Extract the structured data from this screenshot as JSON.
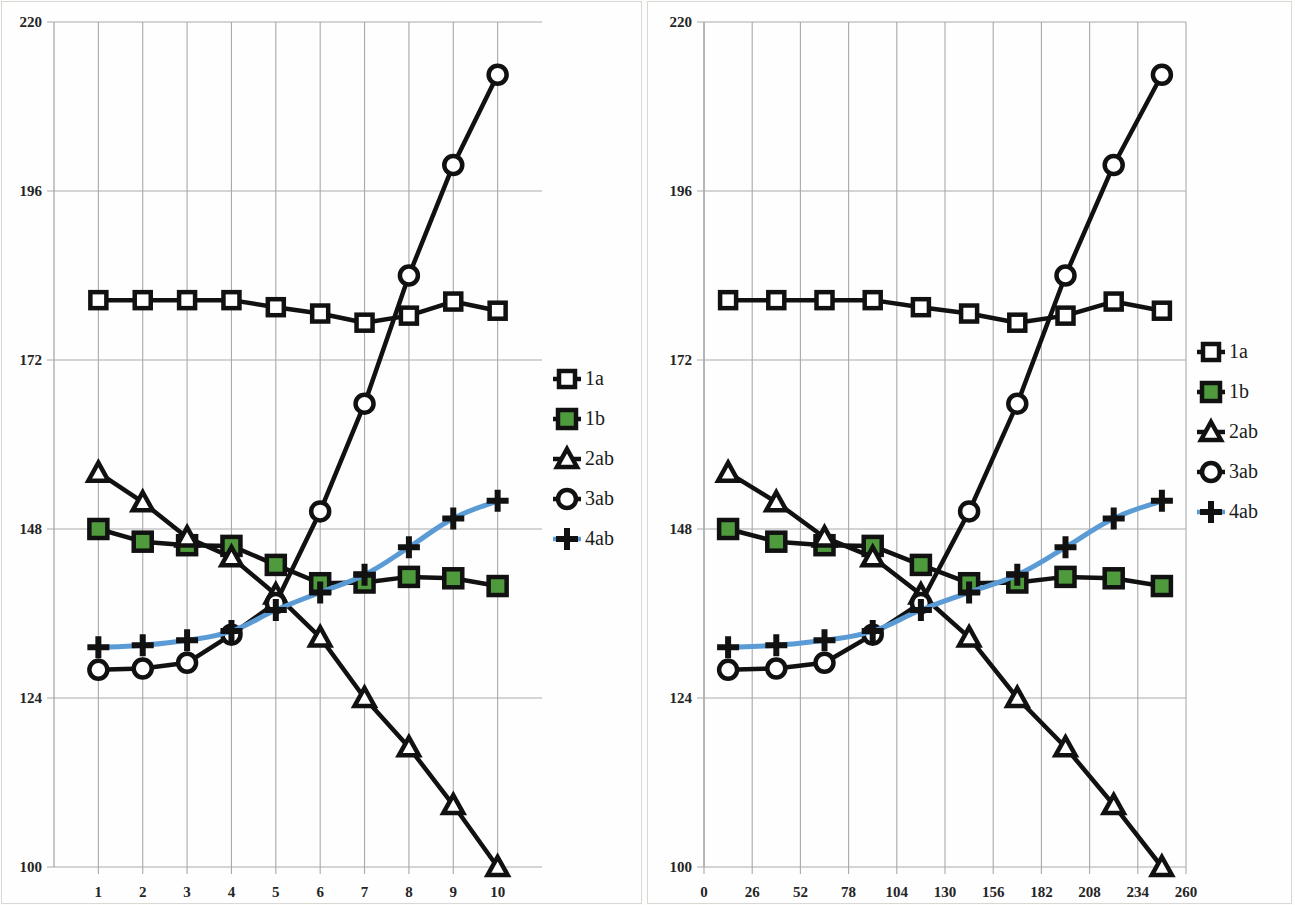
{
  "chart_data": [
    {
      "id": "left",
      "type": "line",
      "title": "",
      "xlabel": "",
      "ylabel": "",
      "grid": true,
      "legend_position": "right",
      "xlim": [
        0,
        11
      ],
      "ylim": [
        100,
        220
      ],
      "yticks": [
        100,
        124,
        148,
        172,
        196,
        220
      ],
      "xticks": [
        1,
        2,
        3,
        4,
        5,
        6,
        7,
        8,
        9,
        10
      ],
      "x": [
        1,
        2,
        3,
        4,
        5,
        6,
        7,
        8,
        9,
        10
      ],
      "series": [
        {
          "name": "1a",
          "marker": "square-open",
          "color": "#111111",
          "line_color": "#111111",
          "values": [
            180.5,
            180.5,
            180.5,
            180.5,
            179.5,
            178.6,
            177.3,
            178.3,
            180.3,
            179.0
          ]
        },
        {
          "name": "1b",
          "marker": "square-filled",
          "color": "#4E9A3C",
          "line_color": "#111111",
          "values": [
            148.0,
            146.2,
            145.7,
            145.6,
            142.9,
            140.3,
            140.4,
            141.2,
            141.0,
            139.9
          ]
        },
        {
          "name": "2ab",
          "marker": "triangle-open",
          "color": "#111111",
          "line_color": "#111111",
          "values": [
            156.0,
            151.8,
            146.8,
            144.0,
            138.7,
            132.6,
            124.0,
            117.0,
            108.8,
            100.0
          ]
        },
        {
          "name": "3ab",
          "marker": "circle-open",
          "color": "#111111",
          "line_color": "#111111",
          "values": [
            128.0,
            128.2,
            129.0,
            133.0,
            137.5,
            150.5,
            165.8,
            184.0,
            199.7,
            212.5
          ]
        },
        {
          "name": "4ab",
          "marker": "plus",
          "color": "#111111",
          "line_color": "#5B9BD5",
          "values": [
            131.2,
            131.5,
            132.2,
            133.5,
            136.5,
            139.0,
            141.5,
            145.4,
            149.5,
            152.0
          ]
        }
      ]
    },
    {
      "id": "right",
      "type": "line",
      "title": "",
      "xlabel": "",
      "ylabel": "",
      "grid": true,
      "legend_position": "right",
      "xlim": [
        0,
        260
      ],
      "ylim": [
        100,
        220
      ],
      "yticks": [
        100,
        124,
        148,
        172,
        196,
        220
      ],
      "xticks": [
        0,
        26,
        52,
        78,
        104,
        130,
        156,
        182,
        208,
        234,
        260
      ],
      "x": [
        13,
        39,
        65,
        91,
        117,
        143,
        169,
        195,
        221,
        247
      ],
      "series": [
        {
          "name": "1a",
          "marker": "square-open",
          "color": "#111111",
          "line_color": "#111111",
          "values": [
            180.5,
            180.5,
            180.5,
            180.5,
            179.5,
            178.6,
            177.3,
            178.3,
            180.3,
            179.0
          ]
        },
        {
          "name": "1b",
          "marker": "square-filled",
          "color": "#4E9A3C",
          "line_color": "#111111",
          "values": [
            148.0,
            146.2,
            145.7,
            145.6,
            142.9,
            140.3,
            140.4,
            141.2,
            141.0,
            139.9
          ]
        },
        {
          "name": "2ab",
          "marker": "triangle-open",
          "color": "#111111",
          "line_color": "#111111",
          "values": [
            156.0,
            151.8,
            146.8,
            144.0,
            138.7,
            132.6,
            124.0,
            117.0,
            108.8,
            100.0
          ]
        },
        {
          "name": "3ab",
          "marker": "circle-open",
          "color": "#111111",
          "line_color": "#111111",
          "values": [
            128.0,
            128.2,
            129.0,
            133.0,
            137.5,
            150.5,
            165.8,
            184.0,
            199.7,
            212.5
          ]
        },
        {
          "name": "4ab",
          "marker": "plus",
          "color": "#111111",
          "line_color": "#5B9BD5",
          "values": [
            131.2,
            131.5,
            132.2,
            133.5,
            136.5,
            139.0,
            141.5,
            145.4,
            149.5,
            152.0
          ]
        }
      ]
    }
  ],
  "legend": {
    "entries": [
      {
        "label": "1a",
        "marker": "square-open"
      },
      {
        "label": "1b",
        "marker": "square-filled"
      },
      {
        "label": "2ab",
        "marker": "triangle-open"
      },
      {
        "label": "3ab",
        "marker": "circle-open"
      },
      {
        "label": "4ab",
        "marker": "plus"
      }
    ]
  },
  "colors": {
    "line": "#111111",
    "accent_blue": "#5B9BD5",
    "marker_green": "#4E9A3C",
    "grid": "#a9a9a9",
    "panel_border": "#d8d8d4",
    "tick_text": "#252525"
  }
}
